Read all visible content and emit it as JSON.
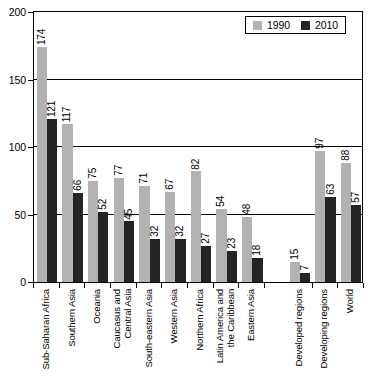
{
  "chart_data": {
    "type": "bar",
    "title": "",
    "xlabel": "",
    "ylabel": "",
    "ylim": [
      0,
      200
    ],
    "yticks": [
      0,
      50,
      100,
      150,
      200
    ],
    "ytick_labels": [
      "0",
      "50",
      "100",
      "150",
      "200"
    ],
    "grid": "horizontal",
    "legend_position": "top-right",
    "categories": [
      "Sub-Saharan Africa",
      "Southern Asia",
      "Oceania",
      "Caucasus and\nCentral Asia",
      "South-eastern Asia",
      "Western Asia",
      "Northern Africa",
      "Latin America and\nthe Caribbean",
      "Eastern Asia",
      "Developed regions",
      "Developing regions",
      "World"
    ],
    "series": [
      {
        "name": "1990",
        "color": "#b2b2b2",
        "values": [
          174,
          117,
          75,
          77,
          71,
          67,
          82,
          54,
          48,
          15,
          97,
          88
        ]
      },
      {
        "name": "2010",
        "color": "#242424",
        "values": [
          121,
          66,
          52,
          45,
          32,
          32,
          27,
          23,
          18,
          7,
          63,
          57
        ]
      }
    ],
    "group_gap_after_index": 8
  },
  "legend": {
    "items": [
      {
        "label": "1990",
        "swatch": "legend-swatch-1990"
      },
      {
        "label": "2010",
        "swatch": "legend-swatch-2010"
      }
    ]
  },
  "colors": {
    "series_1990": "#b2b2b2",
    "series_2010": "#242424",
    "axis": "#000000",
    "background": "#ffffff"
  }
}
